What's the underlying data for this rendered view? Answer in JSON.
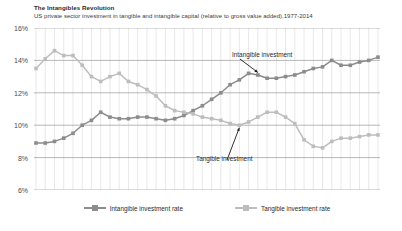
{
  "header": {
    "title": "The Intangibles Revolution",
    "subtitle": "US private sector investment in tangible and intangible capital (relative to gross value added),1977-2014"
  },
  "annotations": {
    "intangible": "Intangible investment",
    "tangible": "Tangible investment"
  },
  "legend": {
    "intangible_label": "Intangible investment rate",
    "tangible_label": "Tangible investment rate"
  },
  "axis": {
    "y_ticks": [
      "16%",
      "14%",
      "12%",
      "10%",
      "8%",
      "6%"
    ]
  },
  "colors": {
    "intangible": "#8c8c8c",
    "tangible": "#bdbdbd",
    "grid": "#d9d9d9",
    "axis_line": "#9a9a9a",
    "text": "#3b3b3b",
    "background": "#ffffff"
  },
  "chart_data": {
    "type": "line",
    "title": "The Intangibles Revolution",
    "subtitle": "US private sector investment in tangible and intangible capital (relative to gross value added),1977-2014",
    "xlabel": "",
    "ylabel": "",
    "ylim": [
      6,
      16
    ],
    "ytick_values": [
      6,
      8,
      10,
      12,
      14,
      16
    ],
    "ytick_labels": [
      "6%",
      "8%",
      "10%",
      "12%",
      "14%",
      "16%"
    ],
    "grid": true,
    "grid_vertical": true,
    "legend_position": "bottom",
    "x": [
      1977,
      1978,
      1979,
      1980,
      1981,
      1982,
      1983,
      1984,
      1985,
      1986,
      1987,
      1988,
      1989,
      1990,
      1991,
      1992,
      1993,
      1994,
      1995,
      1996,
      1997,
      1998,
      1999,
      2000,
      2001,
      2002,
      2003,
      2004,
      2005,
      2006,
      2007,
      2008,
      2009,
      2010,
      2011,
      2012,
      2013,
      2014
    ],
    "series": [
      {
        "name": "Intangible investment rate",
        "color": "#8c8c8c",
        "marker": "square",
        "values": [
          8.9,
          8.9,
          9.0,
          9.2,
          9.5,
          10.0,
          10.3,
          10.8,
          10.5,
          10.4,
          10.4,
          10.5,
          10.5,
          10.4,
          10.3,
          10.4,
          10.6,
          10.9,
          11.2,
          11.6,
          12.0,
          12.5,
          12.8,
          13.2,
          13.1,
          12.9,
          12.9,
          13.0,
          13.1,
          13.3,
          13.5,
          13.6,
          14.0,
          13.7,
          13.7,
          13.9,
          14.0,
          14.2
        ]
      },
      {
        "name": "Tangible investment rate",
        "color": "#bdbdbd",
        "marker": "square",
        "values": [
          13.5,
          14.1,
          14.6,
          14.3,
          14.3,
          13.7,
          13.0,
          12.7,
          13.0,
          13.2,
          12.7,
          12.5,
          12.2,
          11.8,
          11.2,
          10.9,
          10.8,
          10.7,
          10.5,
          10.4,
          10.3,
          10.1,
          10.0,
          10.2,
          10.5,
          10.8,
          10.8,
          10.5,
          10.1,
          9.1,
          8.7,
          8.6,
          9.0,
          9.2,
          9.2,
          9.3,
          9.4,
          9.4
        ]
      }
    ],
    "annotations": [
      {
        "text": "Intangible investment",
        "series": "Intangible investment rate",
        "points_to_year": 2001
      },
      {
        "text": "Tangible investment",
        "series": "Tangible investment rate",
        "points_to_year": 1999
      }
    ]
  }
}
